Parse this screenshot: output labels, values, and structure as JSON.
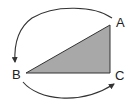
{
  "diagram": {
    "type": "triangle-rotation",
    "colors": {
      "triangle_fill": "#a8a8a8",
      "stroke": "#333333",
      "text": "#222222",
      "background": "#ffffff"
    },
    "vertices": [
      {
        "label": "A",
        "position": "top-right"
      },
      {
        "label": "B",
        "position": "bottom-left"
      },
      {
        "label": "C",
        "position": "bottom-right"
      }
    ],
    "arrows": [
      {
        "from": "A",
        "to": "B",
        "direction": "counterclockwise-over-top"
      },
      {
        "from": "B",
        "to": "C",
        "direction": "along-bottom"
      }
    ]
  }
}
